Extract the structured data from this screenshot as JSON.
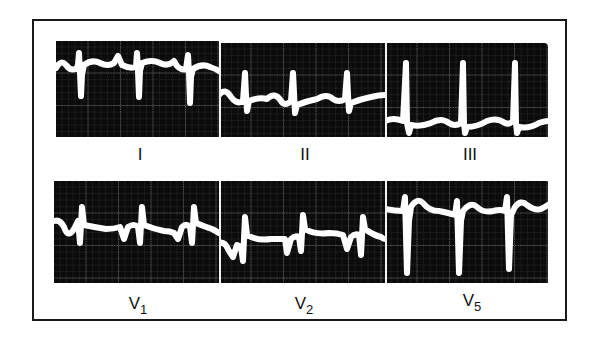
{
  "figure": {
    "title": "",
    "rows": [
      {
        "leads": [
          {
            "name": "I",
            "label": "I"
          },
          {
            "name": "II",
            "label": "II"
          },
          {
            "name": "III",
            "label": "III"
          }
        ]
      },
      {
        "leads": [
          {
            "name": "V1",
            "label": "V",
            "sub": "1"
          },
          {
            "name": "V2",
            "label": "V",
            "sub": "2"
          },
          {
            "name": "V5",
            "label": "V",
            "sub": "5"
          }
        ]
      }
    ],
    "colors": {
      "background": "#ffffff",
      "panel": "#0b0b0b",
      "trace": "#ffffff",
      "grid": "#8a8a8a",
      "frame": "#1a1a1a"
    }
  }
}
